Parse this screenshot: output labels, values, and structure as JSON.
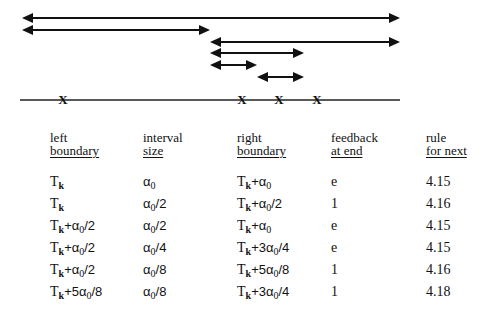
{
  "diagram": {
    "arrows": [
      {
        "x1": 22,
        "x2": 400,
        "y": 18
      },
      {
        "x1": 22,
        "x2": 210,
        "y": 30
      },
      {
        "x1": 210,
        "x2": 400,
        "y": 42
      },
      {
        "x1": 210,
        "x2": 304,
        "y": 53
      },
      {
        "x1": 210,
        "x2": 257,
        "y": 65
      },
      {
        "x1": 257,
        "x2": 304,
        "y": 77
      }
    ],
    "baseline": {
      "x1": 20,
      "x2": 400,
      "y": 100
    },
    "marks": [
      {
        "x": 63,
        "label": "X"
      },
      {
        "x": 242,
        "label": "X"
      },
      {
        "x": 279,
        "label": "X"
      },
      {
        "x": 317,
        "label": "X"
      }
    ]
  },
  "table": {
    "headers": [
      {
        "line1": "left",
        "line2": "boundary"
      },
      {
        "line1": "interval",
        "line2": "size"
      },
      {
        "line1": "right",
        "line2": "boundary"
      },
      {
        "line1": "feedback",
        "line2": "at end"
      },
      {
        "line1": "rule",
        "line2": "for next"
      }
    ],
    "rows": [
      {
        "left": "Tk",
        "size": "α0",
        "right": "Tk+α0",
        "feedback": "e",
        "rule": "4.15"
      },
      {
        "left": "Tk",
        "size": "α0/2",
        "right": "Tk+α0/2",
        "feedback": "1",
        "rule": "4.16"
      },
      {
        "left": "Tk+α0/2",
        "size": "α0/2",
        "right": "Tk+α0",
        "feedback": "e",
        "rule": "4.15"
      },
      {
        "left": "Tk+α0/2",
        "size": "α0/4",
        "right": "Tk+3α0/4",
        "feedback": "e",
        "rule": "4.15"
      },
      {
        "left": "Tk+α0/2",
        "size": "α0/8",
        "right": "Tk+5α0/8",
        "feedback": "1",
        "rule": "4.16"
      },
      {
        "left": "Tk+5α0/8",
        "size": "α0/8",
        "right": "Tk+3α0/4",
        "feedback": "1",
        "rule": "4.18"
      }
    ]
  }
}
